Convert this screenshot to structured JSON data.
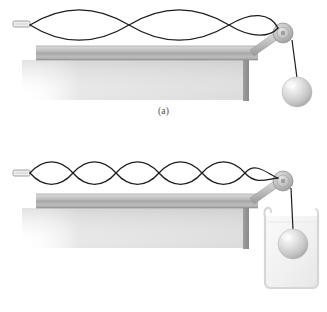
{
  "figure": {
    "background_color": "#ffffff"
  },
  "colors": {
    "string": "#1e1e1e",
    "table_top": "#b5b5b5",
    "table_top_light": "#d6d6d6",
    "table_edge": "#9a9a9a",
    "table_leg": "#8f8f8f",
    "shadow": "#cfcfcf",
    "pulley_body": "#b8b8b8",
    "pulley_rim": "#8e8e8e",
    "rod": "#c2c2c2",
    "sphere_light": "#f2f2f2",
    "sphere_mid": "#cccccc",
    "sphere_dark": "#a8a8a8",
    "beaker_outline": "#d3d3d3",
    "beaker_fill": "#f4f4f4",
    "clamp": "#e8e8e8",
    "clamp_outline": "#8a8a8a",
    "label_text": "#4a4a4a"
  },
  "panels": [
    {
      "id": "a",
      "label": "(a)",
      "wave": {
        "loops": 2,
        "harmonic_label": "n = 2",
        "amplitude_px": 12,
        "axis_y": 25,
        "x_start": 30,
        "x_end": 288
      },
      "sphere": {
        "label": "hanging sphere",
        "submerged": false,
        "cx": 297,
        "cy": 92,
        "r": 15
      },
      "beaker": {
        "present": false
      },
      "table": {
        "x": 36,
        "y": 46,
        "width": 222,
        "top_thickness": 7,
        "edge_thickness": 7,
        "leg_x": 243,
        "leg_width": 6,
        "leg_bottom": 101
      },
      "pulley": {
        "cx": 283,
        "cy": 33,
        "r": 10
      },
      "clamp": {
        "x": 13,
        "y": 21,
        "width": 17,
        "height": 6
      }
    },
    {
      "id": "b",
      "label": "(b)",
      "wave": {
        "loops": 5,
        "harmonic_label": "n = 5",
        "amplitude_px": 9,
        "axis_y": 17,
        "x_start": 30,
        "x_end": 288
      },
      "sphere": {
        "label": "sphere submerged in liquid",
        "submerged": true,
        "cx": 293,
        "cy": 88,
        "r": 15
      },
      "beaker": {
        "present": true,
        "label": "beaker of liquid",
        "x": 262,
        "y": 58,
        "width": 58,
        "height": 74,
        "spout_side": "left"
      },
      "table": {
        "x": 36,
        "y": 38,
        "width": 222,
        "top_thickness": 7,
        "edge_thickness": 7,
        "leg_x": 243,
        "leg_width": 6,
        "leg_bottom": 93
      },
      "pulley": {
        "cx": 283,
        "cy": 25,
        "r": 10
      },
      "clamp": {
        "x": 13,
        "y": 13,
        "width": 17,
        "height": 6
      }
    }
  ]
}
